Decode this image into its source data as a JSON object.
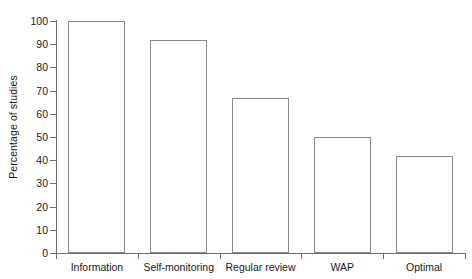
{
  "chart_data": {
    "type": "bar",
    "title": "",
    "xlabel": "",
    "ylabel": "Percentage of studies",
    "categories": [
      "Information",
      "Self-monitoring",
      "Regular review",
      "WAP",
      "Optimal"
    ],
    "values": [
      100,
      92,
      67,
      50,
      42
    ],
    "ylim": [
      0,
      100
    ],
    "yticks": [
      0,
      10,
      20,
      30,
      40,
      50,
      60,
      70,
      80,
      90,
      100
    ],
    "ytick_labels": [
      "0",
      "10",
      "20",
      "30",
      "40",
      "50",
      "60",
      "70",
      "80",
      "90",
      "100"
    ],
    "grid": false,
    "legend": null,
    "bar_fill_color": "#ffffff",
    "bar_edge_color": "#8a8a8a",
    "axis_color": "#6e6e6e",
    "text_color": "#1a1a1a",
    "background_color": "#ffffff"
  }
}
